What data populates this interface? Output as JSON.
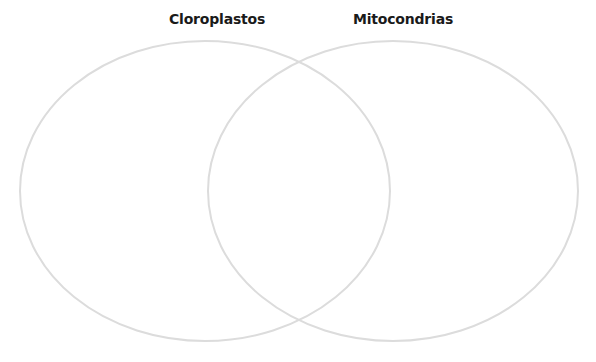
{
  "diagram": {
    "type": "venn",
    "sets": [
      {
        "id": "left",
        "label": "Cloroplastos",
        "cx": 205,
        "cy": 191,
        "rx": 185,
        "ry": 150,
        "stroke": "#dcdcdc"
      },
      {
        "id": "right",
        "label": "Mitocondrias",
        "cx": 393,
        "cy": 191,
        "rx": 185,
        "ry": 150,
        "stroke": "#dcdcdc"
      }
    ],
    "regions": {
      "left_only": "",
      "overlap": "",
      "right_only": ""
    }
  }
}
